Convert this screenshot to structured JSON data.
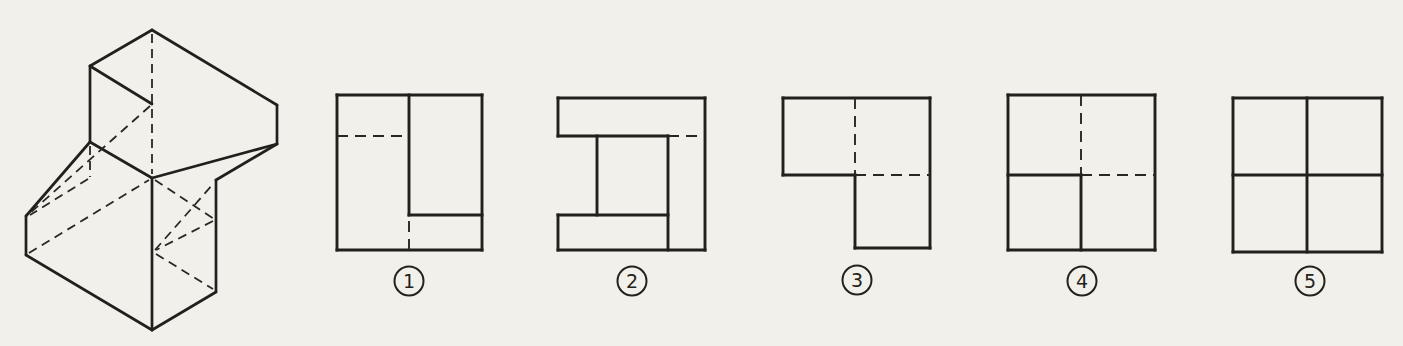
{
  "page": {
    "background": "#f2f0eb",
    "ink": "#221f1c"
  },
  "question_figure": {
    "name": "isometric-object",
    "solid_segments": [
      [
        152,
        30,
        277,
        105
      ],
      [
        152,
        30,
        90,
        66
      ],
      [
        90,
        66,
        152,
        104
      ],
      [
        90,
        66,
        90,
        142
      ],
      [
        277,
        105,
        277,
        144
      ],
      [
        277,
        144,
        152,
        178
      ],
      [
        90,
        142,
        152,
        178
      ],
      [
        90,
        142,
        26,
        216
      ],
      [
        26,
        216,
        26,
        255
      ],
      [
        26,
        255,
        152,
        330
      ],
      [
        152,
        330,
        216,
        292
      ],
      [
        216,
        292,
        216,
        180
      ],
      [
        216,
        180,
        277,
        144
      ],
      [
        152,
        178,
        152,
        330
      ]
    ],
    "hidden_segments": [
      [
        152,
        34,
        152,
        174
      ],
      [
        150,
        106,
        29,
        214
      ],
      [
        90,
        146,
        90,
        177
      ],
      [
        88,
        179,
        30,
        215
      ],
      [
        29,
        253,
        149,
        180
      ],
      [
        155,
        180,
        214,
        219
      ],
      [
        213,
        221,
        156,
        250
      ],
      [
        156,
        254,
        213,
        289
      ],
      [
        155,
        250,
        214,
        183
      ]
    ]
  },
  "badge_radius": 14.5,
  "options": [
    {
      "label": "1",
      "badge": {
        "cx": 409,
        "cy": 281
      },
      "solid_segments": [
        [
          337,
          95,
          482,
          95
        ],
        [
          482,
          95,
          482,
          250
        ],
        [
          482,
          250,
          337,
          250
        ],
        [
          337,
          250,
          337,
          95
        ],
        [
          409,
          95,
          409,
          215
        ],
        [
          409,
          215,
          482,
          215
        ]
      ],
      "hidden_segments": [
        [
          337,
          136,
          409,
          136
        ],
        [
          409,
          221,
          409,
          250
        ]
      ]
    },
    {
      "label": "2",
      "badge": {
        "cx": 632,
        "cy": 281
      },
      "solid_segments": [
        [
          558,
          98,
          705,
          98
        ],
        [
          705,
          98,
          705,
          250
        ],
        [
          705,
          250,
          558,
          250
        ],
        [
          558,
          98,
          558,
          136
        ],
        [
          558,
          215,
          558,
          250
        ],
        [
          558,
          136,
          668,
          136
        ],
        [
          558,
          215,
          668,
          215
        ],
        [
          597,
          136,
          597,
          215
        ],
        [
          668,
          136,
          668,
          250
        ]
      ],
      "hidden_segments": [
        [
          668,
          136,
          705,
          136
        ]
      ]
    },
    {
      "label": "3",
      "badge": {
        "cx": 857,
        "cy": 280
      },
      "solid_segments": [
        [
          783,
          98,
          930,
          98
        ],
        [
          930,
          98,
          930,
          248
        ],
        [
          930,
          248,
          855,
          248
        ],
        [
          855,
          248,
          855,
          175
        ],
        [
          855,
          175,
          783,
          175
        ],
        [
          783,
          175,
          783,
          98
        ]
      ],
      "hidden_segments": [
        [
          855,
          98,
          855,
          175
        ],
        [
          855,
          175,
          930,
          175
        ]
      ]
    },
    {
      "label": "4",
      "badge": {
        "cx": 1082,
        "cy": 281
      },
      "solid_segments": [
        [
          1008,
          95,
          1155,
          95
        ],
        [
          1155,
          95,
          1155,
          250
        ],
        [
          1155,
          250,
          1008,
          250
        ],
        [
          1008,
          250,
          1008,
          95
        ],
        [
          1081,
          175,
          1081,
          250
        ],
        [
          1008,
          175,
          1081,
          175
        ]
      ],
      "hidden_segments": [
        [
          1081,
          95,
          1081,
          175
        ],
        [
          1081,
          175,
          1155,
          175
        ]
      ]
    },
    {
      "label": "5",
      "badge": {
        "cx": 1310,
        "cy": 281
      },
      "solid_segments": [
        [
          1233,
          98,
          1382,
          98
        ],
        [
          1382,
          98,
          1382,
          252
        ],
        [
          1382,
          252,
          1233,
          252
        ],
        [
          1233,
          252,
          1233,
          98
        ],
        [
          1307,
          98,
          1307,
          252
        ],
        [
          1233,
          175,
          1382,
          175
        ]
      ],
      "hidden_segments": []
    }
  ]
}
